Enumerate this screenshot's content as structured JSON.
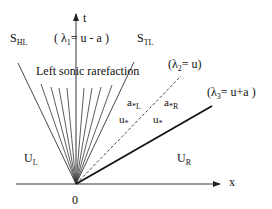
{
  "diagram": {
    "axes": {
      "x_label": "x",
      "t_label": "t",
      "origin_label": "0"
    },
    "waves": {
      "lambda1": {
        "open": "( λ",
        "sub": "1",
        "rest": "= u - a )"
      },
      "lambda2": {
        "open": "(λ",
        "sub": "2",
        "rest": "= u)"
      },
      "lambda3": {
        "open": "(λ",
        "sub": "3",
        "rest": "= u+a )"
      }
    },
    "rarefaction_label": "Left sonic rarefaction",
    "head_label": {
      "main": "S",
      "sub": "HL"
    },
    "tail_label": {
      "main": "S",
      "sub": "TL"
    },
    "regions": {
      "left": {
        "main": "U",
        "sub": "L"
      },
      "right": {
        "main": "U",
        "sub": "R"
      },
      "star_left_a": {
        "main": "a",
        "sub": "*L"
      },
      "star_right_a": {
        "main": "a",
        "sub": "*R"
      },
      "star_left_u": {
        "main": "u",
        "sub": "*"
      },
      "star_right_u": {
        "main": "u",
        "sub": "*"
      }
    }
  }
}
